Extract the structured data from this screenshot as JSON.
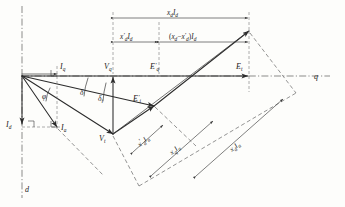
{
  "figure": {
    "axes": {
      "q_axis_label": "q",
      "d_axis_label": "d"
    },
    "phasors": [
      {
        "name": "Iq",
        "label_base": "I",
        "label_sub": "q",
        "label_prime": ""
      },
      {
        "name": "Vq",
        "label_base": "V",
        "label_sub": "q",
        "label_prime": ""
      },
      {
        "name": "Eqp",
        "label_base": "E",
        "label_sub": "q",
        "label_prime": "′"
      },
      {
        "name": "Et",
        "label_base": "E",
        "label_sub": "t",
        "label_prime": ""
      },
      {
        "name": "Eip",
        "label_base": "E",
        "label_sub": "i",
        "label_prime": "′"
      },
      {
        "name": "Vt",
        "label_base": "V",
        "label_sub": "t",
        "label_prime": ""
      },
      {
        "name": "Id",
        "label_base": "I",
        "label_sub": "d",
        "label_prime": ""
      },
      {
        "name": "Ia",
        "label_base": "I",
        "label_sub": "a",
        "label_prime": ""
      }
    ],
    "angles": [
      {
        "name": "phi",
        "symbol": "φ",
        "sub": ""
      },
      {
        "name": "delta",
        "symbol": "δ",
        "sub": ""
      },
      {
        "name": "delta_i",
        "symbol": "δ",
        "sub": "i"
      }
    ],
    "dimensions_top": [
      {
        "name": "xd-Id",
        "text": "x I",
        "x_base": "x",
        "x_sub": "d",
        "x_prime": "",
        "i_base": "I",
        "i_sub": "d",
        "bracket": ""
      },
      {
        "name": "xdp-Id",
        "text": "x′ I",
        "x_base": "x",
        "x_sub": "d",
        "x_prime": "′",
        "i_base": "I",
        "i_sub": "d",
        "bracket": ""
      },
      {
        "name": "xd-minus-xdp-Id",
        "text": "( x − x′ ) I",
        "x_base": "x",
        "x_sub": "d",
        "x_prime": "′",
        "i_base": "I",
        "i_sub": "d",
        "bracket": "paren"
      }
    ],
    "dimensions_diagonal": [
      {
        "name": "xdp-Ia",
        "x_base": "x",
        "x_sub": "d",
        "x_prime": "′",
        "i_base": "I",
        "i_sub": "a"
      },
      {
        "name": "xq-Ia",
        "x_base": "x",
        "x_sub": "q",
        "x_prime": "",
        "i_base": "I",
        "i_sub": "a"
      },
      {
        "name": "xd-Ia",
        "x_base": "x",
        "x_sub": "d",
        "x_prime": "",
        "i_base": "I",
        "i_sub": "a"
      }
    ],
    "colors": {
      "ink": "#2b2b2b",
      "thin_ink": "#3a3a3a",
      "construction": "#5a5a5a",
      "background": "#fdfdfb"
    }
  }
}
